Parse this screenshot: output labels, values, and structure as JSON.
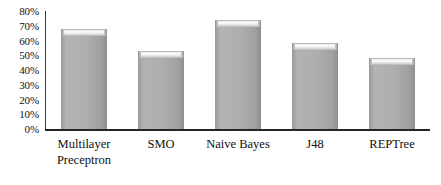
{
  "chart_data": {
    "type": "bar",
    "title": "",
    "subtitle": "",
    "xlabel": "",
    "ylabel": "",
    "categories": [
      "Multilayer Preceptron",
      "SMO",
      "Naive Bayes",
      "J48",
      "REPTree"
    ],
    "category_lines": [
      [
        "Multilayer",
        "Preceptron"
      ],
      [
        "SMO",
        ""
      ],
      [
        "Naive Bayes",
        ""
      ],
      [
        "J48",
        ""
      ],
      [
        "REPTree",
        ""
      ]
    ],
    "values": [
      68,
      53,
      74,
      58,
      48
    ],
    "value_labels": [
      "68%",
      "53%",
      "74%",
      "58%",
      "48%"
    ],
    "ylim": [
      0,
      80
    ],
    "ytick_values": [
      80,
      70,
      60,
      50,
      40,
      30,
      20,
      10,
      0
    ],
    "ytick_labels": [
      "80%",
      "70%",
      "60%",
      "50%",
      "40%",
      "30%",
      "20%",
      "10%",
      "0%"
    ],
    "grid": false,
    "legend": null,
    "legend_position": "none",
    "bar_color": "#a8a8a8",
    "bar_highlight_color": "#f7f7f7",
    "axis_color": "#262626",
    "background_color": "#ffffff"
  }
}
